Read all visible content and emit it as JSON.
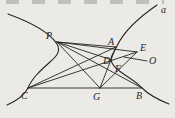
{
  "figure": {
    "width": 175,
    "height": 118,
    "background_color": "#eceae6",
    "ink_color": "#262522",
    "curve_label": "a",
    "points": {
      "P": [
        57,
        42
      ],
      "A": [
        116,
        47
      ],
      "E": [
        137,
        52
      ],
      "D": [
        112,
        60
      ],
      "F": [
        121,
        67
      ],
      "C": [
        28,
        88
      ],
      "G": [
        100,
        88
      ],
      "B": [
        142,
        88
      ]
    },
    "curves": [
      {
        "name": "curve-left-branch",
        "d": "M 8 14 C 30 22 50 33 57 44 C 61 51 57 56 50 62 C 41 70 32 78 28 88 C 24 96 16 101 7 105"
      },
      {
        "name": "curve-right-branch",
        "d": "M 157 5 C 141 16 124 31 117 46 C 113 54 109 58 112 63 C 114 67 119 71 125 75 C 133 80 137 83 142 88 C 149 95 159 100 169 104"
      }
    ],
    "lines": [
      {
        "name": "line-C-B",
        "from": "C",
        "to": "B"
      },
      {
        "name": "line-P-A",
        "from": "P",
        "to": "A"
      },
      {
        "name": "line-P-E",
        "from": "P",
        "to": "E"
      },
      {
        "name": "line-P-D",
        "from": "P",
        "to": "D"
      },
      {
        "name": "line-P-B",
        "from": "P",
        "to": "B"
      },
      {
        "name": "line-P-G",
        "from": "P",
        "to": "G"
      },
      {
        "name": "line-C-E-through-D",
        "from": "C",
        "to": "E"
      },
      {
        "name": "line-C-A",
        "from": "C",
        "to": "A"
      },
      {
        "name": "line-G-A",
        "from": "G",
        "to": "A"
      },
      {
        "name": "line-G-E-through-F",
        "from": "G",
        "to": "E"
      },
      {
        "name": "line-O-leader",
        "x1": 124,
        "y1": 57,
        "x2": 147,
        "y2": 61
      }
    ],
    "labels": [
      {
        "text": "P",
        "x": 46,
        "y": 39
      },
      {
        "text": "A",
        "x": 108,
        "y": 45
      },
      {
        "text": "E",
        "x": 140,
        "y": 51
      },
      {
        "text": "O",
        "x": 149,
        "y": 64
      },
      {
        "text": "D",
        "x": 103,
        "y": 64
      },
      {
        "text": "F",
        "x": 115,
        "y": 72
      },
      {
        "text": "C",
        "x": 21,
        "y": 99
      },
      {
        "text": "G",
        "x": 93,
        "y": 100
      },
      {
        "text": "B",
        "x": 136,
        "y": 99
      },
      {
        "text": "a",
        "x": 161,
        "y": 13
      }
    ]
  }
}
